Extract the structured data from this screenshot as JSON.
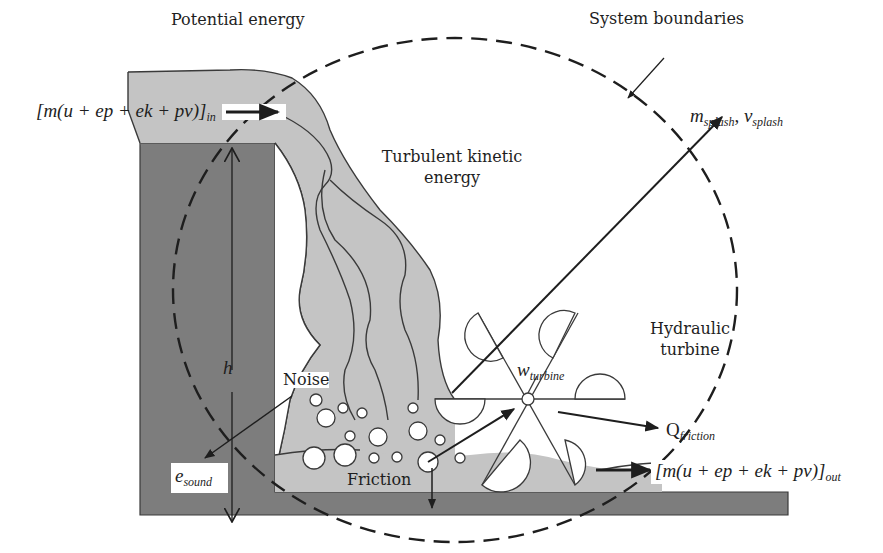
{
  "diagram": {
    "title_labels": {
      "potential_energy": "Potential energy",
      "system_boundaries": "System boundaries",
      "turbulent_kinetic_line1": "Turbulent kinetic",
      "turbulent_kinetic_line2": "energy",
      "hydraulic_turbine_line1": "Hydraulic",
      "hydraulic_turbine_line2": "turbine",
      "noise": "Noise",
      "friction": "Friction",
      "height": "h"
    },
    "math_labels": {
      "inflow_main": "[m(u + ep + ek + pv)]",
      "inflow_sub": "in",
      "outflow_main": "[m(u + ep + ek + pv)]",
      "outflow_sub": "out",
      "splash_m": "m",
      "splash_m_sub": "splash",
      "splash_sep": ", ",
      "splash_v": "v",
      "splash_v_sub": "splash",
      "work": "w",
      "work_sub": "turbine",
      "heat": "Q",
      "heat_sub": "friction",
      "sound": "e",
      "sound_sub": "sound"
    },
    "colors": {
      "wall": "#7d7d7d",
      "water": "#c4c4c4",
      "outline": "#3a3a3a",
      "ink": "#1e1e1e",
      "background": "#ffffff"
    }
  }
}
